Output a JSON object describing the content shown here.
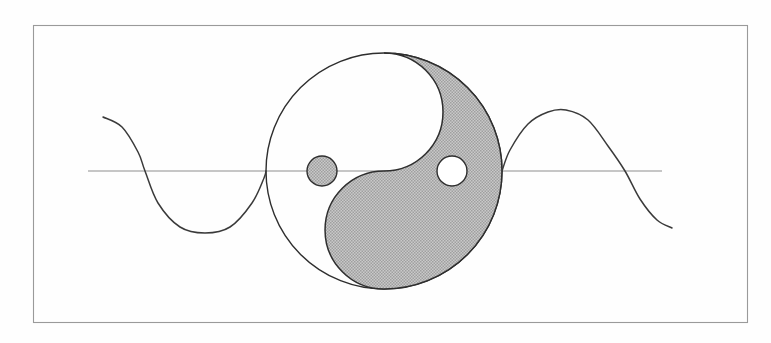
{
  "figure": {
    "title": "Yin-yang symbol superimposed on a sine wave",
    "caption": "",
    "background_color": "#fefefe",
    "frame": {
      "name": "border-frame",
      "x": 33,
      "y": 25,
      "width": 715,
      "height": 298,
      "stroke_color": "#9a9a9a",
      "stroke_width": 1.1,
      "fill": "none"
    },
    "axis": {
      "name": "horizontal-axis",
      "label": "",
      "x_start": 88,
      "x_end": 662,
      "y": 171,
      "stroke_color": "#8d8d8d",
      "stroke_width": 1.1
    },
    "colors": {
      "shaded_gray": "#b5b5b5",
      "outline_dark": "#2e2e2e",
      "curve_stroke": "#3a3a3a",
      "axis_stroke": "#8d8d8d",
      "frame_stroke": "#9a9a9a",
      "page_background": "#fefefe",
      "white_fill": "#ffffff"
    }
  },
  "chart_data": {
    "type": "line",
    "title": "Yin-yang symbol superimposed on a sine wave",
    "xlabel": "",
    "ylabel": "",
    "grid": false,
    "legend": "none",
    "xlim": [
      103,
      672
    ],
    "ylim": [
      48,
      295
    ],
    "axis_y_pixel": 171,
    "series": [
      {
        "name": "sine-wave-left",
        "description": "Descending sine segment from upper left, through a trough, rising to the yin-yang left intersection",
        "points": [
          [
            103,
            117
          ],
          [
            122,
            127
          ],
          [
            138,
            152
          ],
          [
            145,
            171
          ],
          [
            158,
            203
          ],
          [
            180,
            227
          ],
          [
            205,
            233
          ],
          [
            230,
            227
          ],
          [
            252,
            203
          ],
          [
            264,
            178
          ],
          [
            266,
            171
          ]
        ]
      },
      {
        "name": "sine-wave-right",
        "description": "Sine segment continuing from the yin-yang right intersection up over a crest and down past the axis",
        "points": [
          [
            502,
            171
          ],
          [
            510,
            150
          ],
          [
            528,
            124
          ],
          [
            548,
            112
          ],
          [
            566,
            110
          ],
          [
            588,
            120
          ],
          [
            608,
            146
          ],
          [
            625,
            171
          ],
          [
            640,
            199
          ],
          [
            657,
            220
          ],
          [
            672,
            228
          ]
        ]
      }
    ],
    "annotations": [
      {
        "name": "yin-yang-symbol",
        "kind": "taijitu",
        "center": [
          384,
          171
        ],
        "radius": 118,
        "dark_half": "right",
        "light_half": "left",
        "small_dot_light": {
          "center": [
            322,
            171
          ],
          "radius": 15,
          "fill": "#b5b5b5"
        },
        "small_dot_dark": {
          "center": [
            452,
            171
          ],
          "radius": 15,
          "fill": "#ffffff"
        }
      }
    ]
  },
  "geometry": {
    "yin_yang": {
      "name": "yin-yang-symbol",
      "cx": 384,
      "cy": 171,
      "r": 118,
      "half_r": 59,
      "dot_r": 15,
      "dot_left_cx": 322,
      "dot_right_cx": 452
    }
  }
}
